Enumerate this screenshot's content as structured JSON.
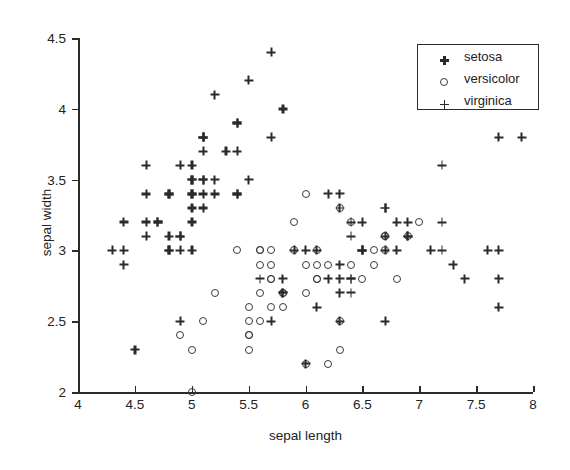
{
  "chart_data": {
    "type": "scatter",
    "title": "",
    "xlabel": "sepal length",
    "ylabel": "sepal width",
    "xlim": [
      4,
      8
    ],
    "ylim": [
      2,
      4.5
    ],
    "xticks": [
      4,
      4.5,
      5,
      5.5,
      6,
      6.5,
      7,
      7.5,
      8
    ],
    "xticklabels": [
      "4",
      "4.5",
      "5",
      "5.5",
      "6",
      "6.5",
      "7",
      "7.5",
      "8"
    ],
    "yticks": [
      2,
      2.5,
      3,
      3.5,
      4,
      4.5
    ],
    "yticklabels": [
      "2",
      "2.5",
      "3",
      "3.5",
      "4",
      "4.5"
    ],
    "grid": false,
    "legend_position": "upper right",
    "series": [
      {
        "name": "setosa",
        "marker": "star-asterisk",
        "color": "#2a2a2a",
        "points": [
          [
            5.1,
            3.5
          ],
          [
            4.9,
            3.0
          ],
          [
            4.7,
            3.2
          ],
          [
            4.6,
            3.1
          ],
          [
            5.0,
            3.6
          ],
          [
            5.4,
            3.9
          ],
          [
            4.6,
            3.4
          ],
          [
            5.0,
            3.4
          ],
          [
            4.4,
            2.9
          ],
          [
            4.9,
            3.1
          ],
          [
            5.4,
            3.7
          ],
          [
            4.8,
            3.4
          ],
          [
            4.8,
            3.0
          ],
          [
            4.3,
            3.0
          ],
          [
            5.8,
            4.0
          ],
          [
            5.7,
            4.4
          ],
          [
            5.4,
            3.9
          ],
          [
            5.1,
            3.5
          ],
          [
            5.7,
            3.8
          ],
          [
            5.1,
            3.8
          ],
          [
            5.4,
            3.4
          ],
          [
            5.1,
            3.7
          ],
          [
            4.6,
            3.6
          ],
          [
            5.1,
            3.3
          ],
          [
            4.8,
            3.4
          ],
          [
            5.0,
            3.0
          ],
          [
            5.0,
            3.4
          ],
          [
            5.2,
            3.5
          ],
          [
            5.2,
            3.4
          ],
          [
            4.7,
            3.2
          ],
          [
            4.8,
            3.1
          ],
          [
            5.4,
            3.4
          ],
          [
            5.2,
            4.1
          ],
          [
            5.5,
            4.2
          ],
          [
            4.9,
            3.1
          ],
          [
            5.0,
            3.2
          ],
          [
            5.5,
            3.5
          ],
          [
            4.9,
            3.6
          ],
          [
            4.4,
            3.0
          ],
          [
            5.1,
            3.4
          ],
          [
            5.0,
            3.5
          ],
          [
            4.5,
            2.3
          ],
          [
            4.4,
            3.2
          ],
          [
            5.0,
            3.5
          ],
          [
            5.1,
            3.8
          ],
          [
            4.8,
            3.0
          ],
          [
            5.1,
            3.8
          ],
          [
            4.6,
            3.2
          ],
          [
            5.3,
            3.7
          ],
          [
            5.0,
            3.3
          ]
        ]
      },
      {
        "name": "versicolor",
        "marker": "open-circle",
        "color": "#3a3a3a",
        "points": [
          [
            7.0,
            3.2
          ],
          [
            6.4,
            3.2
          ],
          [
            6.9,
            3.1
          ],
          [
            5.5,
            2.3
          ],
          [
            6.5,
            2.8
          ],
          [
            5.7,
            2.8
          ],
          [
            6.3,
            3.3
          ],
          [
            4.9,
            2.4
          ],
          [
            6.6,
            2.9
          ],
          [
            5.2,
            2.7
          ],
          [
            5.0,
            2.0
          ],
          [
            5.9,
            3.0
          ],
          [
            6.0,
            2.2
          ],
          [
            6.1,
            2.9
          ],
          [
            5.6,
            2.9
          ],
          [
            6.7,
            3.1
          ],
          [
            5.6,
            3.0
          ],
          [
            5.8,
            2.7
          ],
          [
            6.2,
            2.2
          ],
          [
            5.6,
            2.5
          ],
          [
            5.9,
            3.2
          ],
          [
            6.1,
            2.8
          ],
          [
            6.3,
            2.5
          ],
          [
            6.1,
            2.8
          ],
          [
            6.4,
            2.9
          ],
          [
            6.6,
            3.0
          ],
          [
            6.8,
            2.8
          ],
          [
            6.7,
            3.0
          ],
          [
            6.0,
            2.9
          ],
          [
            5.7,
            2.6
          ],
          [
            5.5,
            2.4
          ],
          [
            5.5,
            2.4
          ],
          [
            5.8,
            2.7
          ],
          [
            6.0,
            2.7
          ],
          [
            5.4,
            3.0
          ],
          [
            6.0,
            3.4
          ],
          [
            6.7,
            3.1
          ],
          [
            6.3,
            2.3
          ],
          [
            5.6,
            3.0
          ],
          [
            5.5,
            2.5
          ],
          [
            5.5,
            2.6
          ],
          [
            6.1,
            3.0
          ],
          [
            5.8,
            2.6
          ],
          [
            5.0,
            2.3
          ],
          [
            5.6,
            2.7
          ],
          [
            5.7,
            3.0
          ],
          [
            5.7,
            2.9
          ],
          [
            6.2,
            2.9
          ],
          [
            5.1,
            2.5
          ],
          [
            5.7,
            2.8
          ]
        ]
      },
      {
        "name": "virginica",
        "marker": "plus",
        "color": "#2a2a2a",
        "points": [
          [
            6.3,
            3.3
          ],
          [
            5.8,
            2.7
          ],
          [
            7.1,
            3.0
          ],
          [
            6.3,
            2.9
          ],
          [
            6.5,
            3.0
          ],
          [
            7.6,
            3.0
          ],
          [
            4.9,
            2.5
          ],
          [
            7.3,
            2.9
          ],
          [
            6.7,
            2.5
          ],
          [
            7.2,
            3.6
          ],
          [
            6.5,
            3.2
          ],
          [
            6.4,
            2.7
          ],
          [
            6.8,
            3.0
          ],
          [
            5.7,
            2.5
          ],
          [
            5.8,
            2.8
          ],
          [
            6.4,
            3.2
          ],
          [
            6.5,
            3.0
          ],
          [
            7.7,
            3.8
          ],
          [
            7.7,
            2.6
          ],
          [
            6.0,
            2.2
          ],
          [
            6.9,
            3.2
          ],
          [
            5.6,
            2.8
          ],
          [
            7.7,
            2.8
          ],
          [
            6.3,
            2.7
          ],
          [
            6.7,
            3.3
          ],
          [
            7.2,
            3.2
          ],
          [
            6.2,
            2.8
          ],
          [
            6.1,
            3.0
          ],
          [
            6.4,
            2.8
          ],
          [
            7.2,
            3.0
          ],
          [
            7.4,
            2.8
          ],
          [
            7.9,
            3.8
          ],
          [
            6.4,
            2.8
          ],
          [
            6.3,
            2.8
          ],
          [
            6.1,
            2.6
          ],
          [
            7.7,
            3.0
          ],
          [
            6.3,
            3.4
          ],
          [
            6.4,
            3.1
          ],
          [
            6.0,
            3.0
          ],
          [
            6.9,
            3.1
          ],
          [
            6.7,
            3.1
          ],
          [
            6.9,
            3.1
          ],
          [
            5.8,
            2.7
          ],
          [
            6.8,
            3.2
          ],
          [
            6.7,
            3.3
          ],
          [
            6.7,
            3.0
          ],
          [
            6.3,
            2.5
          ],
          [
            6.5,
            3.0
          ],
          [
            6.2,
            3.4
          ],
          [
            5.9,
            3.0
          ]
        ]
      }
    ]
  }
}
